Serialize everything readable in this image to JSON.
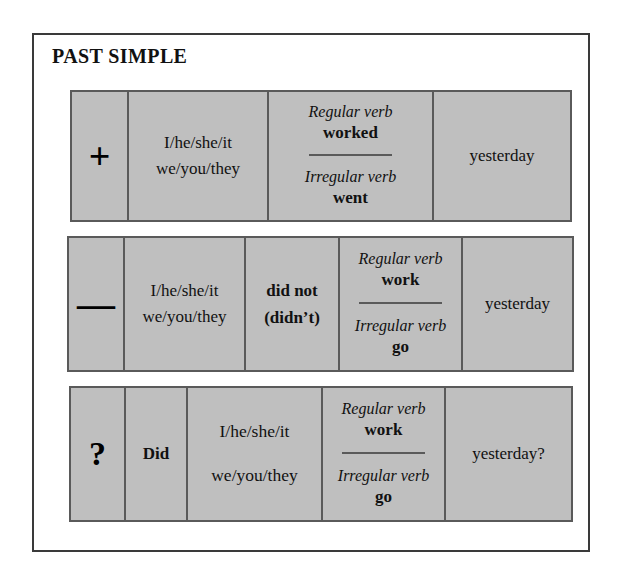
{
  "page": {
    "title": "PAST SIMPLE"
  },
  "labels": {
    "regular_verb": "Regular verb",
    "irregular_verb": "Irregular verb"
  },
  "colors": {
    "cell_fill": "#bfbfbf",
    "cell_border": "#5a5a5a",
    "frame_border": "#3a3a3a",
    "page_background": "#ffffff",
    "text": "#111111"
  },
  "rows": [
    {
      "id": "positive",
      "symbol": "+",
      "symbol_name": "plus-sign",
      "pronouns": {
        "line1": "I/he/she/it",
        "line2": "we/you/they"
      },
      "verb": {
        "regular_label": "Regular verb",
        "regular_form": "worked",
        "irregular_label": "Irregular verb",
        "irregular_form": "went"
      },
      "time": "yesterday"
    },
    {
      "id": "negative",
      "symbol": "—",
      "symbol_name": "minus-sign",
      "pronouns": {
        "line1": "I/he/she/it",
        "line2": "we/you/they"
      },
      "auxiliary": {
        "line1": "did not",
        "line2": "(didn’t)"
      },
      "verb": {
        "regular_label": "Regular verb",
        "regular_form": "work",
        "irregular_label": "Irregular verb",
        "irregular_form": "go"
      },
      "time": "yesterday"
    },
    {
      "id": "question",
      "symbol": "?",
      "symbol_name": "question-mark",
      "auxiliary_single": "Did",
      "pronouns": {
        "line1": "I/he/she/it",
        "line2": "we/you/they"
      },
      "verb": {
        "regular_label": "Regular verb",
        "regular_form": "work",
        "irregular_label": "Irregular verb",
        "irregular_form": "go"
      },
      "time": "yesterday?"
    }
  ]
}
